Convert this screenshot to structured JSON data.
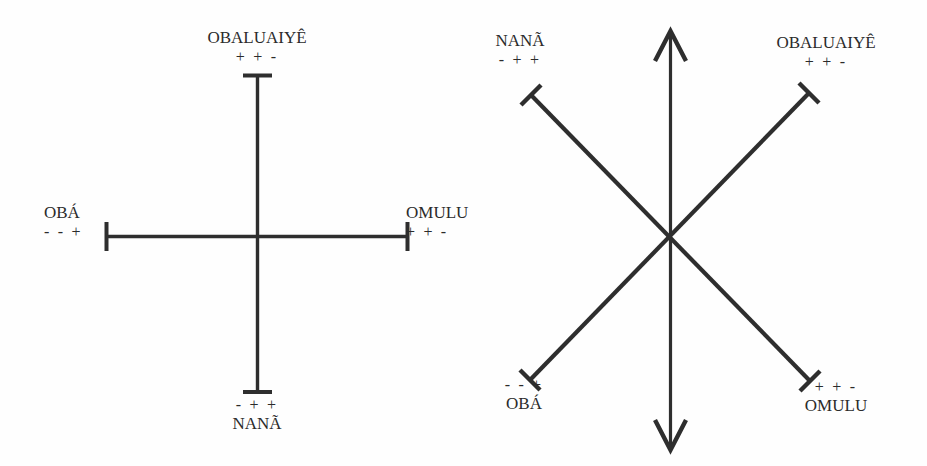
{
  "figure": {
    "background_color": "#fefefe",
    "ink_color": "#2e2e2e",
    "diagrams": [
      {
        "id": "left-cross",
        "kind": "orthogonal-cross",
        "axes": [
          "vertical",
          "horizontal"
        ],
        "endpoint_style": "t-bar",
        "nodes": [
          {
            "position": "top",
            "name": "OBALUAIYÊ",
            "signs": "+ + -"
          },
          {
            "position": "left",
            "name": "OBÁ",
            "signs": "- - +"
          },
          {
            "position": "right",
            "name": "OMULU",
            "signs": "+ + -"
          },
          {
            "position": "bottom",
            "name": "NANÃ",
            "signs": "- + +"
          }
        ]
      },
      {
        "id": "right-star",
        "kind": "diagonal-cross-with-vertical-arrow",
        "axes": [
          "vertical-double-arrow",
          "diagonal-nw-se",
          "diagonal-ne-sw"
        ],
        "endpoint_style": "t-bar",
        "nodes": [
          {
            "position": "top-left",
            "name": "NANÃ",
            "signs": "- + +"
          },
          {
            "position": "top-right",
            "name": "OBALUAIYÊ",
            "signs": "+ + -"
          },
          {
            "position": "bottom-left",
            "name": "OBÁ",
            "signs": "- - +"
          },
          {
            "position": "bottom-right",
            "name": "OMULU",
            "signs": "+ + -"
          }
        ]
      }
    ]
  }
}
